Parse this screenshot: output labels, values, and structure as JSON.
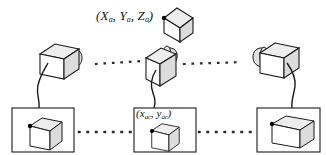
{
  "figure": {
    "type": "camera-network-diagram",
    "background_color": "#ffffff",
    "line_color": "#1a1a1a",
    "face_top_color": "#ededed",
    "face_side_color": "#dcdcdc",
    "face_front_color": "#ffffff",
    "marker_color": "#000000"
  },
  "labels": {
    "world_point": {
      "text": "(Xa, Ya, Za)",
      "open_paren": "(",
      "close_paren": ")",
      "terms": [
        {
          "symbol": "X",
          "subscript": "a"
        },
        {
          "symbol": "Y",
          "subscript": "a"
        },
        {
          "symbol": "Z",
          "subscript": "a"
        }
      ],
      "separator": ", ",
      "description": "3D world coordinates of object point"
    },
    "image_point": {
      "text": "(xac, yac)",
      "open_paren": "(",
      "close_paren": ")",
      "terms": [
        {
          "symbol": "x",
          "subscript": "ac"
        },
        {
          "symbol": "y",
          "subscript": "ac"
        }
      ],
      "separator": ", ",
      "description": "2D image coordinates of projected point in camera c"
    }
  },
  "objects": {
    "world_cube": {
      "name": "world-cube",
      "has_corner_marker": true
    },
    "cameras": [
      {
        "id": "camera-left",
        "name": "camera-left",
        "orientation": "lens-right",
        "tilted": false
      },
      {
        "id": "camera-middle",
        "name": "camera-middle",
        "orientation": "lens-front",
        "tilted": true
      },
      {
        "id": "camera-right",
        "name": "camera-right",
        "orientation": "lens-left",
        "tilted": false
      }
    ],
    "image_panels": [
      {
        "id": "image-panel-left",
        "name": "image-panel-left",
        "cube_view": "narrow",
        "has_corner_marker": true
      },
      {
        "id": "image-panel-middle",
        "name": "image-panel-middle",
        "cube_view": "narrow",
        "has_corner_marker": true,
        "label": "image_point"
      },
      {
        "id": "image-panel-right",
        "name": "image-panel-right",
        "cube_view": "wide",
        "has_corner_marker": true
      }
    ],
    "connectors": {
      "camera_row_dotted": 2,
      "panel_row_dotted": 2,
      "cables": 3,
      "style": "square-dots"
    }
  }
}
